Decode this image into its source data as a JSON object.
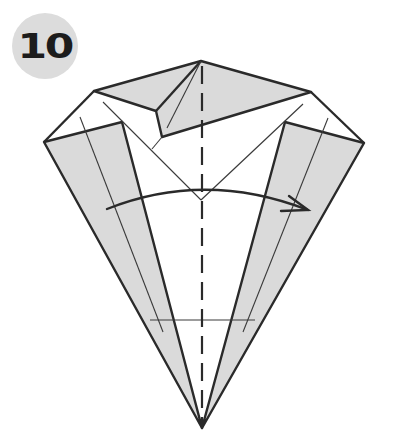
{
  "step": {
    "number": "10"
  },
  "colors": {
    "paper_shaded": "#dadada",
    "paper_white": "#ffffff",
    "line": "#2a2a2a",
    "badge_bg": "#dcdcdc"
  },
  "diagram": {
    "fold_line": "valley-center-vertical",
    "arrow": "curved-fold-arrow-left-to-right"
  }
}
